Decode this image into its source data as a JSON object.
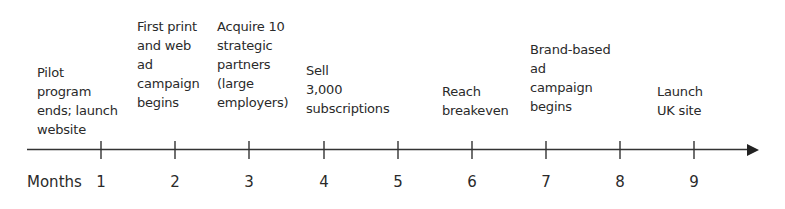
{
  "timeline": {
    "axis_label": "Months",
    "months": [
      "1",
      "2",
      "3",
      "4",
      "5",
      "6",
      "7",
      "8",
      "9"
    ],
    "milestones": [
      {
        "month": 1,
        "text": "Pilot\nprogram\nends; launch\nwebsite"
      },
      {
        "month": 2,
        "text": "First print\nand web\nad\ncampaign\nbegins"
      },
      {
        "month": 3,
        "text": "Acquire 10\nstrategic\npartners\n(large\nemployers)"
      },
      {
        "month": 4,
        "text": "Sell\n3,000\nsubscriptions"
      },
      {
        "month": 6,
        "text": "Reach\nbreakeven"
      },
      {
        "month": 7,
        "text": "Brand-based\nad\ncampaign\nbegins"
      },
      {
        "month": 9,
        "text": "Launch\nUK site"
      }
    ]
  },
  "colors": {
    "line": "#333333",
    "text": "#2a2a2a",
    "background": "#ffffff"
  }
}
